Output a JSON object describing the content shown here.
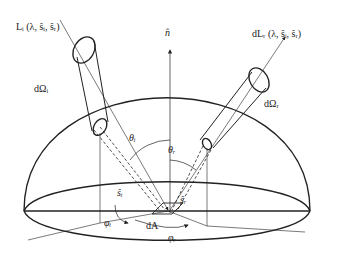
{
  "diagram": {
    "labels": {
      "normal": "n̂",
      "incident_radiance": "Lᵢ (λ, ŝᵢ, ŝᵣ)",
      "reflected_radiance": "dLᵣ (λ, ŝᵢ, ŝᵣ)",
      "incident_solid_angle": "dΩᵢ",
      "reflected_solid_angle": "dΩᵣ",
      "incident_zenith": "θᵢ",
      "reflected_zenith": "θᵣ",
      "incident_direction": "ŝᵢ",
      "reflected_direction": "ŝᵣ",
      "incident_azimuth": "φᵢ",
      "reflected_azimuth": "φᵣ",
      "area_element": "dA"
    },
    "colors": {
      "stroke": "#222222",
      "background": "#ffffff"
    }
  }
}
